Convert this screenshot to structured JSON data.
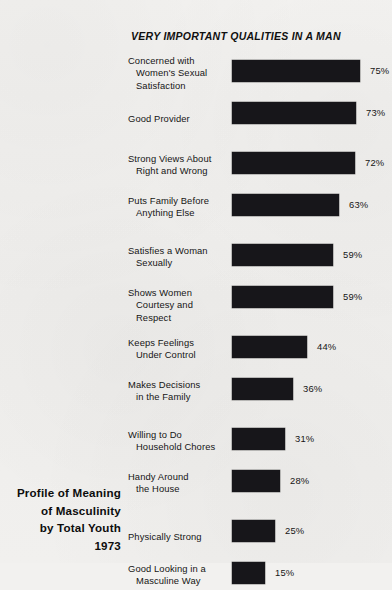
{
  "chart_data": {
    "type": "bar",
    "orientation": "horizontal",
    "title": "VERY IMPORTANT QUALITIES IN A MAN",
    "xlabel": "",
    "ylabel": "",
    "xlim": [
      0,
      100
    ],
    "grid": false,
    "legend": null,
    "value_suffix": "%",
    "categories": [
      "Concerned with Women's Sexual Satisfaction",
      "Good Provider",
      "Strong Views About Right and Wrong",
      "Puts Family Before Anything Else",
      "Satisfies a Woman Sexually",
      "Shows Women Courtesy and Respect",
      "Keeps Feelings Under Control",
      "Makes Decisions in the Family",
      "Willing to Do Household Chores",
      "Handy Around the House",
      "Physically Strong",
      "Good Looking in a Masculine Way"
    ],
    "values": [
      75,
      73,
      72,
      63,
      59,
      59,
      44,
      36,
      31,
      28,
      25,
      15
    ],
    "value_labels": [
      "75%",
      "73%",
      "72%",
      "63%",
      "59%",
      "59%",
      "44%",
      "36%",
      "31%",
      "28%",
      "25%",
      "15%"
    ]
  },
  "rows": [
    {
      "label_lines": [
        "Concerned with",
        "Women's Sexual",
        "Satisfaction"
      ],
      "value": 75,
      "value_label": "75%"
    },
    {
      "label_lines": [
        "Good Provider"
      ],
      "value": 73,
      "value_label": "73%"
    },
    {
      "label_lines": [
        "Strong Views About",
        "Right and Wrong"
      ],
      "value": 72,
      "value_label": "72%"
    },
    {
      "label_lines": [
        "Puts Family Before",
        "Anything Else"
      ],
      "value": 63,
      "value_label": "63%"
    },
    {
      "label_lines": [
        "Satisfies a Woman",
        "Sexually"
      ],
      "value": 59,
      "value_label": "59%"
    },
    {
      "label_lines": [
        "Shows Women",
        "Courtesy and Respect"
      ],
      "value": 59,
      "value_label": "59%"
    },
    {
      "label_lines": [
        "Keeps Feelings",
        "Under Control"
      ],
      "value": 44,
      "value_label": "44%"
    },
    {
      "label_lines": [
        "Makes Decisions",
        "in the Family"
      ],
      "value": 36,
      "value_label": "36%"
    },
    {
      "label_lines": [
        "Willing to Do",
        "Household Chores"
      ],
      "value": 31,
      "value_label": "31%"
    },
    {
      "label_lines": [
        "Handy Around",
        "the House"
      ],
      "value": 28,
      "value_label": "28%"
    },
    {
      "label_lines": [
        "Physically Strong"
      ],
      "value": 25,
      "value_label": "25%"
    },
    {
      "label_lines": [
        "Good Looking in a",
        "Masculine Way"
      ],
      "value": 15,
      "value_label": "15%"
    }
  ],
  "caption": {
    "lines": [
      "Profile of Meaning",
      "of Masculinity",
      "by Total Youth",
      "1973"
    ]
  },
  "style": {
    "bar_color": "#17161a",
    "text_color": "#151515",
    "background_color": "#f2f1ef"
  }
}
